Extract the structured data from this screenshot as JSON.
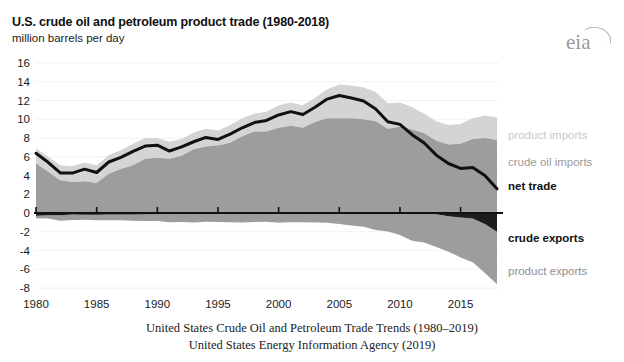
{
  "header": {
    "title": "U.S. crude oil and petroleum product trade (1980-2018)",
    "subtitle": "million barrels per day",
    "logo_text": "eia",
    "logo_icon": "eia-arc-icon"
  },
  "caption": {
    "line1": "United States Crude Oil and Petroleum Trade Trends (1980–2019)",
    "line2": "United States Energy Information Agency (2019)"
  },
  "legend": {
    "product_imports": "product imports",
    "crude_oil_imports": "crude oil imports",
    "net_trade": "net trade",
    "crude_exports": "crude exports",
    "product_exports": "product exports"
  },
  "colors": {
    "product_imports": "#d4d4d4",
    "crude_oil_imports": "#9d9d9d",
    "net_trade": "#111111",
    "crude_exports": "#1d1d1d",
    "product_exports": "#9d9d9d",
    "axis": "#111111",
    "gridline": "#f2f2f2",
    "logo": "#9a9a9a",
    "text": "#1b1b1b"
  },
  "chart_data": {
    "type": "area",
    "title": "U.S. crude oil and petroleum product trade (1980-2018)",
    "subtitle": "million barrels per day",
    "xlabel": "",
    "ylabel": "million barrels per day",
    "xlim": [
      1980,
      2018
    ],
    "ylim": [
      -8,
      16
    ],
    "ytick_values": [
      16,
      14,
      12,
      10,
      8,
      6,
      4,
      2,
      0,
      -2,
      -4,
      -6,
      -8
    ],
    "ytick_labels": [
      "16",
      "14",
      "12",
      "10",
      "8",
      "6",
      "4",
      "2",
      "0",
      "-2",
      "-4",
      "-6",
      "-8"
    ],
    "xtick_values": [
      1980,
      1985,
      1990,
      1995,
      2000,
      2005,
      2010,
      2015
    ],
    "xtick_labels": [
      "1980",
      "1985",
      "1990",
      "1995",
      "2000",
      "2005",
      "2010",
      "2015"
    ],
    "grid": false,
    "legend_position": "right",
    "x": [
      1980,
      1981,
      1982,
      1983,
      1984,
      1985,
      1986,
      1987,
      1988,
      1989,
      1990,
      1991,
      1992,
      1993,
      1994,
      1995,
      1996,
      1997,
      1998,
      1999,
      2000,
      2001,
      2002,
      2003,
      2004,
      2005,
      2006,
      2007,
      2008,
      2009,
      2010,
      2011,
      2012,
      2013,
      2014,
      2015,
      2016,
      2017,
      2018
    ],
    "series": [
      {
        "name": "crude oil imports",
        "stack": "imports",
        "values": [
          5.3,
          4.4,
          3.5,
          3.3,
          3.4,
          3.2,
          4.2,
          4.7,
          5.1,
          5.8,
          5.9,
          5.8,
          6.1,
          6.8,
          7.1,
          7.2,
          7.5,
          8.2,
          8.7,
          8.7,
          9.1,
          9.3,
          9.1,
          9.7,
          10.1,
          10.1,
          10.1,
          10.0,
          9.8,
          9.0,
          9.2,
          8.9,
          8.5,
          7.7,
          7.3,
          7.4,
          7.9,
          8.0,
          7.8
        ]
      },
      {
        "name": "product imports",
        "stack": "imports",
        "values": [
          1.6,
          1.6,
          1.6,
          1.7,
          2.0,
          1.9,
          2.0,
          2.0,
          2.3,
          2.2,
          2.1,
          1.8,
          1.8,
          1.8,
          1.9,
          1.6,
          1.9,
          1.9,
          1.9,
          2.1,
          2.4,
          2.5,
          2.4,
          2.6,
          3.1,
          3.6,
          3.5,
          3.4,
          3.1,
          2.7,
          2.6,
          2.4,
          2.1,
          2.1,
          2.1,
          2.1,
          2.2,
          2.4,
          2.4
        ]
      },
      {
        "name": "crude exports",
        "stack": "exports",
        "values": [
          -0.29,
          -0.23,
          -0.24,
          -0.16,
          -0.18,
          -0.2,
          -0.15,
          -0.15,
          -0.16,
          -0.14,
          -0.11,
          -0.1,
          -0.09,
          -0.1,
          -0.1,
          -0.1,
          -0.11,
          -0.11,
          -0.11,
          -0.12,
          -0.05,
          -0.02,
          -0.01,
          -0.01,
          -0.03,
          -0.03,
          -0.03,
          -0.03,
          -0.03,
          -0.04,
          -0.04,
          -0.05,
          -0.07,
          -0.12,
          -0.35,
          -0.47,
          -0.59,
          -1.18,
          -2.0
        ]
      },
      {
        "name": "product exports",
        "stack": "exports",
        "values": [
          -0.26,
          -0.36,
          -0.58,
          -0.58,
          -0.54,
          -0.58,
          -0.61,
          -0.61,
          -0.66,
          -0.72,
          -0.75,
          -0.89,
          -0.86,
          -0.9,
          -0.84,
          -0.85,
          -0.87,
          -0.9,
          -0.84,
          -0.81,
          -0.99,
          -0.97,
          -0.98,
          -1.01,
          -1.02,
          -1.13,
          -1.31,
          -1.43,
          -1.77,
          -1.92,
          -2.31,
          -2.9,
          -3.07,
          -3.51,
          -3.77,
          -4.27,
          -4.66,
          -5.22,
          -5.6
        ]
      },
      {
        "name": "net trade",
        "type": "line",
        "values": [
          6.37,
          5.41,
          4.28,
          4.26,
          4.68,
          4.32,
          5.44,
          5.94,
          6.58,
          7.14,
          7.24,
          6.61,
          7.05,
          7.6,
          8.06,
          7.85,
          8.42,
          9.09,
          9.65,
          9.87,
          10.46,
          10.81,
          10.51,
          11.28,
          12.15,
          12.54,
          12.26,
          11.94,
          11.1,
          9.74,
          9.45,
          8.35,
          7.46,
          6.17,
          5.28,
          4.76,
          4.85,
          4.0,
          2.58
        ]
      }
    ],
    "annotations": []
  }
}
